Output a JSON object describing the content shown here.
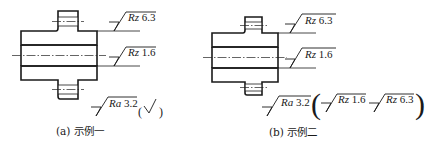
{
  "figure": {
    "panels": [
      {
        "id": "a",
        "caption": "(a) 示例一",
        "callouts": [
          {
            "param": "Rz",
            "value": "6.3",
            "surface": "outer-cylinder"
          },
          {
            "param": "Rz",
            "value": "1.6",
            "surface": "bore"
          }
        ],
        "general_note": {
          "param": "Ra",
          "value": "3.2",
          "bracket": "(√)"
        }
      },
      {
        "id": "b",
        "caption": "(b) 示例二",
        "callouts": [
          {
            "param": "Rz",
            "value": "6.3",
            "surface": "outer-cylinder"
          },
          {
            "param": "Rz",
            "value": "1.6",
            "surface": "bore"
          }
        ],
        "general_note": {
          "param": "Ra",
          "value": "3.2",
          "bracket_items": [
            {
              "param": "Rz",
              "value": "1.6"
            },
            {
              "param": "Rz",
              "value": "6.3"
            }
          ]
        }
      }
    ],
    "labels": {
      "a_rz1_param": "Rz",
      "a_rz1_value": "6.3",
      "a_rz2_param": "Rz",
      "a_rz2_value": "1.6",
      "a_ra_param": "Ra",
      "a_ra_value": "3.2",
      "a_open_paren": "(",
      "a_close_paren": ")",
      "b_rz1_param": "Rz",
      "b_rz1_value": "6.3",
      "b_rz2_param": "Rz",
      "b_rz2_value": "1.6",
      "b_ra_param": "Ra",
      "b_ra_value": "3.2",
      "b_br1_param": "Rz",
      "b_br1_value": "1.6",
      "b_br2_param": "Rz",
      "b_br2_value": "6.3",
      "b_open_paren": "(",
      "b_close_paren": ")",
      "caption_a": "(a) 示例一",
      "caption_b": "(b) 示例二"
    }
  }
}
